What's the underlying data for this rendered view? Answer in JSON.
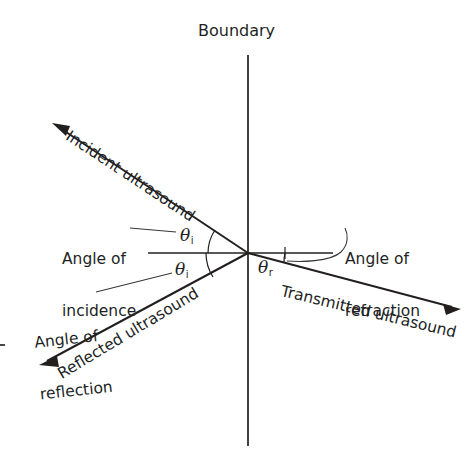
{
  "diagram": {
    "title": "Boundary",
    "origin": {
      "x": 248,
      "y": 253
    },
    "labels": {
      "boundary": "Boundary",
      "incident_ray": "Incident ultrasound",
      "reflected_ray": "Reflected ultrasound",
      "transmitted_ray": "Transmitted ultrasound",
      "angle_of_incidence_line1": "Angle of",
      "angle_of_incidence_line2": "incidence",
      "angle_of_reflection_line1": "Angle of",
      "angle_of_reflection_line2": "reflection",
      "angle_of_refraction_line1": "Angle of",
      "angle_of_refraction_line2": "refraction",
      "theta_i_symbol": "θ",
      "theta_i_subscript": "i",
      "theta_r_symbol": "θ",
      "theta_r_subscript": "r"
    },
    "rays": [
      {
        "name": "incident-ray",
        "label": "Incident ultrasound",
        "from": {
          "x": 248,
          "y": 253
        },
        "to": {
          "x": 52,
          "y": 123
        },
        "arrow_at": "to",
        "angle_from_normal_deg": 33.5
      },
      {
        "name": "reflected-ray",
        "label": "Reflected ultrasound",
        "from": {
          "x": 248,
          "y": 253
        },
        "to": {
          "x": 39,
          "y": 365
        },
        "arrow_at": "to",
        "angle_from_normal_deg": 31
      },
      {
        "name": "transmitted-ray",
        "label": "Transmitted ultrasound",
        "from": {
          "x": 248,
          "y": 253
        },
        "to": {
          "x": 461,
          "y": 309
        },
        "arrow_at": "to",
        "angle_from_normal_deg": 13.5
      }
    ],
    "reference_lines": [
      {
        "name": "boundary-line",
        "orientation": "vertical",
        "from": {
          "x": 248,
          "y": 55
        },
        "to": {
          "x": 248,
          "y": 446
        }
      },
      {
        "name": "normal-line-left",
        "orientation": "horizontal",
        "from": {
          "x": 148,
          "y": 253
        },
        "to": {
          "x": 248,
          "y": 253
        }
      },
      {
        "name": "normal-line-right",
        "orientation": "horizontal",
        "from": {
          "x": 248,
          "y": 253
        },
        "to": {
          "x": 333,
          "y": 253
        }
      }
    ],
    "angle_arcs": [
      {
        "name": "theta-i-incident-arc",
        "label": "θi"
      },
      {
        "name": "theta-i-reflected-arc",
        "label": "θi"
      },
      {
        "name": "theta-r-refracted-arc",
        "label": "θr"
      }
    ],
    "colors": {
      "ink": "#231f1f",
      "background": "#ffffff",
      "leader": "#3a3636"
    }
  }
}
